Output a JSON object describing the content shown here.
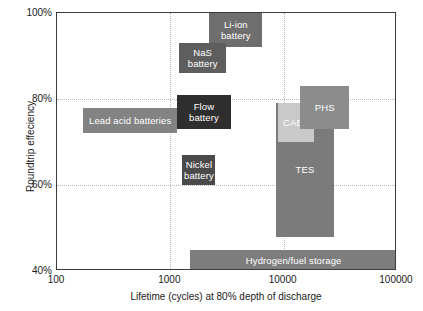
{
  "chart_data": {
    "type": "bar",
    "title": "",
    "xlabel": "Lifetime (cycles) at 80% depth of discharge",
    "ylabel": "Roundtrip effeciency",
    "xscale": "log",
    "xlim": [
      100,
      100000
    ],
    "ylim": [
      40,
      100
    ],
    "xticks": [
      "100",
      "1000",
      "10000",
      "100000"
    ],
    "xtick_values": [
      100,
      1000,
      10000,
      100000
    ],
    "yticks": [
      "40%",
      "60%",
      "80%",
      "100%"
    ],
    "ytick_values": [
      40,
      60,
      80,
      100
    ],
    "grid": true,
    "legend": "none",
    "note": "Ranges shown as shaded rectangles spanning cycle-life (x) and roundtrip efficiency (y) for each storage technology.",
    "boxes": [
      {
        "label": "Li-ion battery",
        "x_min": 2200,
        "x_max": 6500,
        "y_min": 92,
        "y_max": 100,
        "color": "#6e6e6e"
      },
      {
        "label": "NaS battery",
        "x_min": 1200,
        "x_max": 3100,
        "y_min": 86,
        "y_max": 93,
        "color": "#5e5e5e"
      },
      {
        "label": "Flow battery",
        "x_min": 1150,
        "x_max": 3400,
        "y_min": 73,
        "y_max": 81,
        "color": "#2e2e2e"
      },
      {
        "label": "Lead acid batteries",
        "x_min": 170,
        "x_max": 1150,
        "y_min": 72,
        "y_max": 78,
        "color": "#838383"
      },
      {
        "label": "Nickel battery",
        "x_min": 1280,
        "x_max": 2500,
        "y_min": 60,
        "y_max": 67,
        "color": "#4a4a4a"
      },
      {
        "label": "TES",
        "x_min": 8500,
        "x_max": 28000,
        "y_min": 48,
        "y_max": 79,
        "color": "#7b7b7b"
      },
      {
        "label": "CAES",
        "x_min": 9000,
        "x_max": 18500,
        "y_min": 70,
        "y_max": 79,
        "color": "#c9c9c9"
      },
      {
        "label": "PHS",
        "x_min": 14000,
        "x_max": 38000,
        "y_min": 73,
        "y_max": 83,
        "color": "#8c8c8c"
      },
      {
        "label": "Hydrogen/fuel storage",
        "x_min": 1500,
        "x_max": 100000,
        "y_min": 40,
        "y_max": 45,
        "color": "#7d7d7d"
      }
    ]
  },
  "axes": {
    "frame_color": "#3b3b3b",
    "grid_color": "#b9b9b9",
    "text_color": "#1a1a1a"
  }
}
